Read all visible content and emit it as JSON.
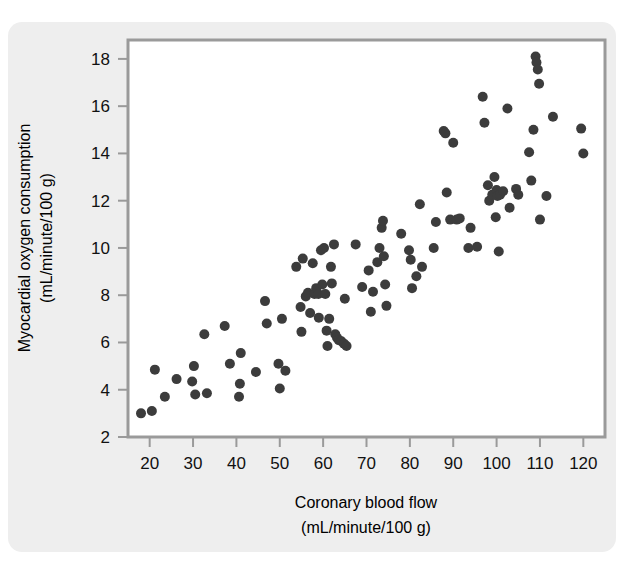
{
  "figure": {
    "background_color": "#eeeeee",
    "plot_background_color": "#ffffff",
    "frame_color": "#9a9a9a",
    "marker_color": "#3c3c3c"
  },
  "chart_data": {
    "type": "scatter",
    "title": "",
    "xlabel": "Coronary blood flow",
    "xlabel_units": "(mL/minute/100 g)",
    "ylabel": "Myocardial oxygen consumption",
    "ylabel_units": "(mL/minute/100 g)",
    "xlim": [
      15,
      125
    ],
    "ylim": [
      2,
      18.8
    ],
    "xticks": [
      20,
      30,
      40,
      50,
      60,
      70,
      80,
      90,
      100,
      110,
      120
    ],
    "xtick_labels": [
      "20",
      "30",
      "40",
      "50",
      "60",
      "70",
      "80",
      "90",
      "100",
      "110",
      "120"
    ],
    "yticks": [
      2,
      4,
      6,
      8,
      10,
      12,
      14,
      16,
      18
    ],
    "ytick_labels": [
      "2",
      "4",
      "6",
      "8",
      "10",
      "12",
      "14",
      "16",
      "18"
    ],
    "grid": false,
    "legend": false,
    "marker": "circle",
    "marker_size": 9,
    "n_points": 118,
    "points": [
      [
        18.0,
        3.0
      ],
      [
        20.5,
        3.1
      ],
      [
        21.2,
        4.85
      ],
      [
        23.5,
        3.7
      ],
      [
        26.2,
        4.45
      ],
      [
        29.8,
        4.35
      ],
      [
        30.2,
        5.0
      ],
      [
        30.5,
        3.8
      ],
      [
        32.6,
        6.35
      ],
      [
        33.2,
        3.85
      ],
      [
        37.3,
        6.7
      ],
      [
        38.5,
        5.1
      ],
      [
        40.6,
        3.7
      ],
      [
        40.8,
        4.25
      ],
      [
        41.0,
        5.55
      ],
      [
        44.5,
        4.75
      ],
      [
        46.6,
        7.75
      ],
      [
        47.0,
        6.8
      ],
      [
        49.7,
        5.1
      ],
      [
        50.0,
        4.05
      ],
      [
        50.5,
        7.0
      ],
      [
        51.3,
        4.8
      ],
      [
        53.8,
        9.2
      ],
      [
        54.8,
        7.5
      ],
      [
        55.0,
        6.45
      ],
      [
        55.3,
        9.55
      ],
      [
        56.0,
        7.95
      ],
      [
        56.5,
        8.1
      ],
      [
        57.0,
        7.25
      ],
      [
        57.6,
        9.35
      ],
      [
        58.0,
        8.05
      ],
      [
        58.4,
        8.3
      ],
      [
        58.9,
        8.05
      ],
      [
        59.0,
        7.05
      ],
      [
        59.5,
        9.9
      ],
      [
        59.8,
        8.45
      ],
      [
        60.2,
        10.0
      ],
      [
        60.5,
        8.05
      ],
      [
        60.8,
        6.5
      ],
      [
        61.0,
        5.85
      ],
      [
        61.4,
        7.0
      ],
      [
        61.8,
        9.2
      ],
      [
        62.0,
        8.5
      ],
      [
        62.5,
        10.15
      ],
      [
        62.8,
        6.35
      ],
      [
        63.2,
        6.2
      ],
      [
        63.6,
        6.1
      ],
      [
        64.2,
        6.05
      ],
      [
        64.8,
        5.95
      ],
      [
        65.0,
        7.85
      ],
      [
        65.4,
        5.85
      ],
      [
        67.5,
        10.15
      ],
      [
        69.0,
        8.35
      ],
      [
        70.5,
        9.05
      ],
      [
        71.0,
        7.3
      ],
      [
        71.5,
        8.15
      ],
      [
        72.5,
        9.4
      ],
      [
        73.0,
        10.0
      ],
      [
        73.5,
        10.85
      ],
      [
        73.8,
        11.15
      ],
      [
        74.0,
        9.65
      ],
      [
        74.3,
        8.45
      ],
      [
        74.6,
        7.55
      ],
      [
        78.0,
        10.6
      ],
      [
        79.8,
        9.9
      ],
      [
        80.2,
        9.5
      ],
      [
        80.5,
        8.3
      ],
      [
        81.5,
        8.8
      ],
      [
        82.3,
        11.85
      ],
      [
        82.8,
        9.2
      ],
      [
        85.5,
        10.0
      ],
      [
        86.0,
        11.1
      ],
      [
        87.8,
        14.95
      ],
      [
        88.2,
        14.85
      ],
      [
        88.5,
        12.35
      ],
      [
        89.3,
        11.2
      ],
      [
        90.0,
        14.45
      ],
      [
        90.8,
        11.2
      ],
      [
        91.5,
        11.25
      ],
      [
        93.5,
        10.0
      ],
      [
        94.0,
        10.85
      ],
      [
        95.5,
        10.05
      ],
      [
        96.8,
        16.4
      ],
      [
        97.2,
        15.3
      ],
      [
        98.0,
        12.65
      ],
      [
        98.3,
        12.0
      ],
      [
        99.0,
        12.25
      ],
      [
        99.5,
        13.0
      ],
      [
        99.8,
        11.3
      ],
      [
        100.0,
        12.45
      ],
      [
        100.2,
        12.2
      ],
      [
        100.5,
        9.85
      ],
      [
        100.8,
        12.25
      ],
      [
        101.5,
        12.4
      ],
      [
        102.5,
        15.9
      ],
      [
        103.0,
        11.7
      ],
      [
        104.5,
        12.5
      ],
      [
        105.0,
        12.25
      ],
      [
        107.5,
        14.05
      ],
      [
        108.0,
        12.85
      ],
      [
        108.5,
        15.0
      ],
      [
        109.0,
        18.1
      ],
      [
        109.2,
        17.85
      ],
      [
        109.5,
        17.55
      ],
      [
        109.8,
        16.95
      ],
      [
        110.0,
        11.2
      ],
      [
        111.5,
        12.2
      ],
      [
        113.0,
        15.55
      ],
      [
        119.5,
        15.05
      ],
      [
        120.0,
        14.0
      ]
    ]
  }
}
